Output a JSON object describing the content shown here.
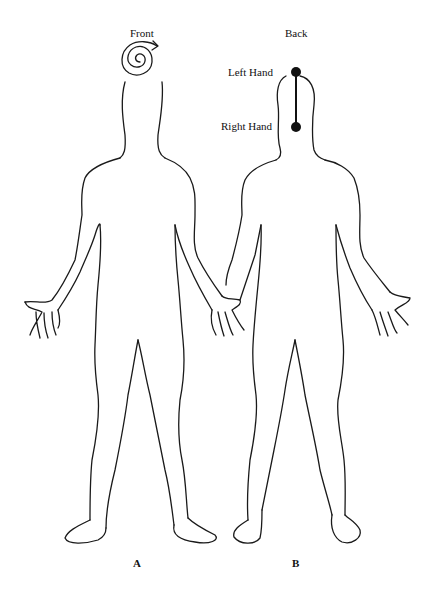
{
  "figure": {
    "panels": [
      {
        "id": "A",
        "label": "A",
        "view_title": "Front",
        "annotation": {
          "type": "spiral-arrow",
          "location": "crown of head",
          "direction": "clockwise"
        }
      },
      {
        "id": "B",
        "label": "B",
        "view_title": "Back",
        "annotation": {
          "type": "line-with-endpoints",
          "location": "back of head",
          "points": [
            {
              "name": "top",
              "label": "Left Hand"
            },
            {
              "name": "bottom",
              "label": "Right Hand"
            }
          ]
        }
      }
    ],
    "colors": {
      "ink": "#1a1a1a",
      "background": "#ffffff"
    }
  }
}
